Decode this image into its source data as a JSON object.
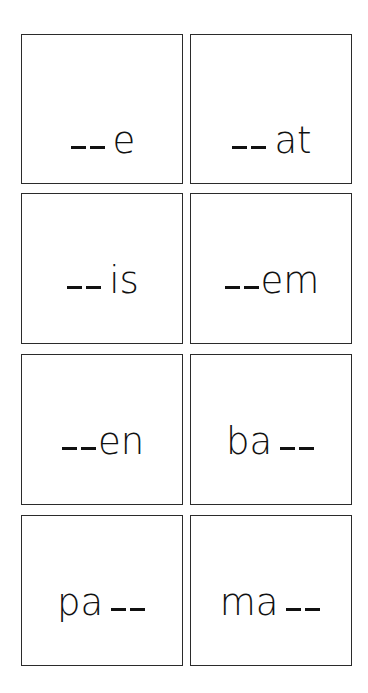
{
  "cards": [
    {
      "parts": [
        "__",
        "e"
      ],
      "text": "__e"
    },
    {
      "parts": [
        "__",
        "at"
      ],
      "text": "__at"
    },
    {
      "parts": [
        "__",
        "is"
      ],
      "text": "__is"
    },
    {
      "parts": [
        "__",
        "em"
      ],
      "text": "__em"
    },
    {
      "parts": [
        "__",
        "en"
      ],
      "text": "__en"
    },
    {
      "parts": [
        "ba",
        "__"
      ],
      "text": "ba__"
    },
    {
      "parts": [
        "pa",
        "__"
      ],
      "text": "pa__"
    },
    {
      "parts": [
        "ma",
        "__"
      ],
      "text": "ma__"
    }
  ],
  "letters": {
    "c0": "e",
    "c1": "at",
    "c2": "is",
    "c3": "em",
    "c4": "en",
    "c5": "ba",
    "c6": "pa",
    "c7": "ma"
  }
}
